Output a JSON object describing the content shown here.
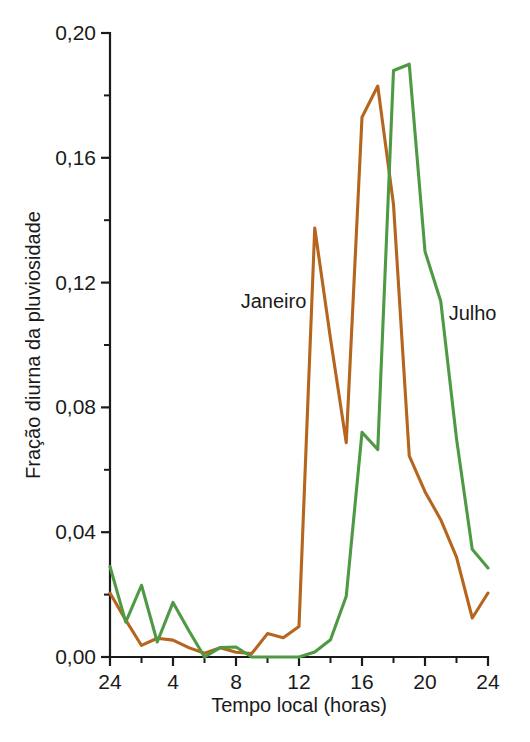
{
  "chart_data": {
    "type": "line",
    "title": "",
    "xlabel": "Tempo local (horas)",
    "ylabel": "Fração diurna da pluviosidade",
    "xlim": [
      0,
      24
    ],
    "ylim": [
      0.0,
      0.2
    ],
    "grid": false,
    "legend_position": "inline-annotations",
    "x_tick_labels": [
      "24",
      "4",
      "8",
      "12",
      "16",
      "20",
      "24"
    ],
    "x_tick_values": [
      0,
      4,
      8,
      12,
      16,
      20,
      24
    ],
    "x_minor_tick_values": [
      2,
      6,
      10,
      14,
      18,
      22
    ],
    "y_tick_labels": [
      "0,00",
      "0,04",
      "0,08",
      "0,12",
      "0,16",
      "0,20"
    ],
    "y_tick_values": [
      0.0,
      0.04,
      0.08,
      0.12,
      0.16,
      0.2
    ],
    "y_minor_tick_values": [
      0.02,
      0.06,
      0.1,
      0.14,
      0.18
    ],
    "x": [
      0,
      1,
      2,
      3,
      4,
      5,
      6,
      7,
      8,
      9,
      10,
      11,
      12,
      13,
      14,
      15,
      16,
      17,
      18,
      19,
      20,
      21,
      22,
      23,
      24
    ],
    "series": [
      {
        "name": "Janeiro",
        "color": "#b5651d",
        "annotation": {
          "text": "Janeiro",
          "x": 8.3,
          "y": 0.112
        },
        "values": [
          0.0205,
          0.0118,
          0.0037,
          0.006,
          0.0054,
          0.003,
          0.0012,
          0.003,
          0.0015,
          0.0011,
          0.0075,
          0.0062,
          0.0098,
          0.1375,
          0.102,
          0.0687,
          0.173,
          0.183,
          0.145,
          0.0645,
          0.053,
          0.044,
          0.032,
          0.0125,
          0.0205
        ]
      },
      {
        "name": "Julho",
        "color": "#4e9a44",
        "annotation": {
          "text": "Julho",
          "x": 21.5,
          "y": 0.108
        },
        "values": [
          0.029,
          0.0112,
          0.023,
          0.0048,
          0.0175,
          0.0085,
          0.0,
          0.003,
          0.0032,
          0.0,
          0.0,
          0.0,
          0.0,
          0.0016,
          0.0055,
          0.0195,
          0.072,
          0.0665,
          0.188,
          0.19,
          0.13,
          0.114,
          0.07,
          0.0345,
          0.0285
        ]
      }
    ]
  }
}
